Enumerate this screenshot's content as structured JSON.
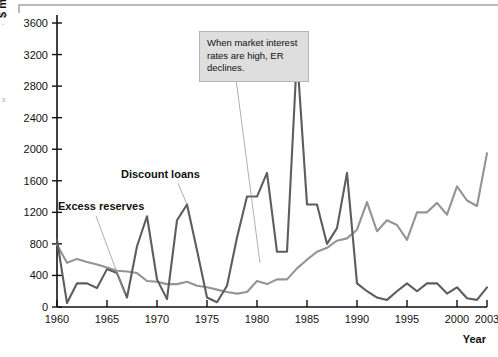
{
  "figure": {
    "ylabel": "$ million",
    "xlabel": "Year",
    "edge_marks": {
      "top": "-",
      "mid": "s"
    }
  },
  "annotation": {
    "text": "When market interest rates are high, ER declines."
  },
  "series_labels": {
    "discount_loans": "Discount loans",
    "excess_reserves": "Excess reserves"
  },
  "colors": {
    "discount_loans": "#5d5d5d",
    "excess_reserves": "#949494",
    "annotation_bg": "#dedede",
    "annotation_border": "#b5b5b5",
    "axis": "#111111"
  },
  "chart_data": {
    "type": "line",
    "title": "",
    "xlabel": "Year",
    "ylabel": "$ million",
    "xlim": [
      1960,
      2003
    ],
    "ylim": [
      0,
      3600
    ],
    "ytick_values": [
      0,
      400,
      800,
      1200,
      1600,
      2000,
      2400,
      2800,
      3200,
      3600
    ],
    "ytick_labels": [
      "0",
      "400",
      "800",
      "1200",
      "1600",
      "2000",
      "2400",
      "2800",
      "3200",
      "3600"
    ],
    "xtick_values": [
      1960,
      1965,
      1970,
      1975,
      1980,
      1985,
      1990,
      1995,
      2000,
      2003
    ],
    "xtick_labels": [
      "1960",
      "1965",
      "1970",
      "1975",
      "1980",
      "1985",
      "1990",
      "1995",
      "2000",
      "2003"
    ],
    "grid": false,
    "legend": "inline-labels",
    "x": [
      1960,
      1961,
      1962,
      1963,
      1964,
      1965,
      1966,
      1967,
      1968,
      1969,
      1970,
      1971,
      1972,
      1973,
      1974,
      1975,
      1976,
      1977,
      1978,
      1979,
      1980,
      1981,
      1982,
      1983,
      1984,
      1985,
      1986,
      1987,
      1988,
      1989,
      1990,
      1991,
      1992,
      1993,
      1994,
      1995,
      1996,
      1997,
      1998,
      1999,
      2000,
      2001,
      2002,
      2003
    ],
    "series": [
      {
        "name": "Excess reserves",
        "color": "#949494",
        "values": [
          790,
          560,
          610,
          570,
          540,
          500,
          460,
          450,
          430,
          330,
          320,
          290,
          290,
          320,
          270,
          250,
          220,
          190,
          170,
          190,
          330,
          290,
          350,
          350,
          490,
          600,
          700,
          750,
          840,
          870,
          980,
          1330,
          960,
          1100,
          1040,
          850,
          1200,
          1200,
          1320,
          1170,
          1530,
          1350,
          1280,
          1950
        ]
      },
      {
        "name": "Discount loans",
        "color": "#5d5d5d",
        "values": [
          850,
          50,
          300,
          300,
          240,
          480,
          430,
          120,
          770,
          1150,
          350,
          100,
          1100,
          1300,
          720,
          120,
          60,
          270,
          880,
          1400,
          1400,
          1700,
          700,
          700,
          3200,
          1300,
          1300,
          800,
          1000,
          1700,
          300,
          200,
          120,
          90,
          200,
          300,
          200,
          300,
          300,
          170,
          250,
          110,
          90,
          250
        ]
      }
    ],
    "annotations": [
      {
        "text": "When market interest rates are high, ER declines.",
        "points_to_x": 1980,
        "points_to_y": 330
      },
      {
        "text": "Discount loans",
        "points_to_x": 1973,
        "points_to_y": 1300
      },
      {
        "text": "Excess reserves",
        "points_to_x": 1964,
        "points_to_y": 540
      }
    ]
  }
}
